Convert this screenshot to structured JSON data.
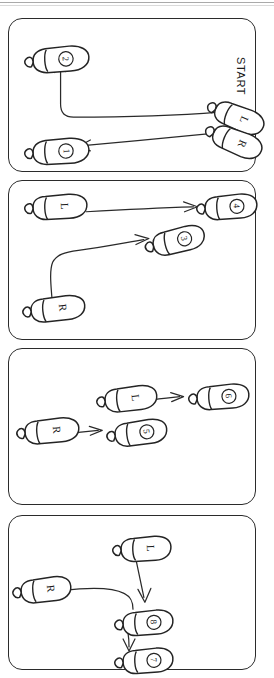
{
  "document": {
    "kind": "hand-drawn footwork / dance step diagram",
    "orientation_note": "sheet scanned sideways; all labels rendered rotated 90 degrees",
    "start_label": "START",
    "foot_side_labels": {
      "left": "L",
      "right": "R"
    }
  },
  "panels": [
    {
      "id": "panel-1",
      "footprints": [
        {
          "name": "footprint-2",
          "label": "2",
          "kind": "numbered"
        },
        {
          "name": "footprint-1",
          "label": "1",
          "kind": "numbered"
        },
        {
          "name": "footprint-start-l",
          "label": "L",
          "kind": "side"
        },
        {
          "name": "footprint-start-r",
          "label": "R",
          "kind": "side"
        }
      ],
      "arrows": [
        {
          "name": "arrow-l-to-2",
          "from": "L",
          "to": "2",
          "path": "bent-left-then-up"
        },
        {
          "name": "arrow-r-to-1",
          "from": "R",
          "to": "1",
          "path": "straight-left"
        }
      ]
    },
    {
      "id": "panel-2",
      "footprints": [
        {
          "name": "footprint-l",
          "label": "L",
          "kind": "side"
        },
        {
          "name": "footprint-4",
          "label": "4",
          "kind": "numbered"
        },
        {
          "name": "footprint-3",
          "label": "3",
          "kind": "numbered"
        },
        {
          "name": "footprint-r",
          "label": "R",
          "kind": "side"
        }
      ],
      "arrows": [
        {
          "name": "arrow-l-to-4",
          "from": "L",
          "to": "4",
          "path": "straight-right"
        },
        {
          "name": "arrow-r-to-3",
          "from": "R",
          "to": "3",
          "path": "up-then-right"
        }
      ]
    },
    {
      "id": "panel-3",
      "footprints": [
        {
          "name": "footprint-l",
          "label": "L",
          "kind": "side"
        },
        {
          "name": "footprint-6",
          "label": "6",
          "kind": "numbered"
        },
        {
          "name": "footprint-r",
          "label": "R",
          "kind": "side"
        },
        {
          "name": "footprint-5",
          "label": "5",
          "kind": "numbered"
        }
      ],
      "arrows": [
        {
          "name": "arrow-l-to-6",
          "from": "L",
          "to": "6",
          "path": "straight-right"
        },
        {
          "name": "arrow-r-to-5",
          "from": "R",
          "to": "5",
          "path": "straight-right"
        }
      ]
    },
    {
      "id": "panel-4",
      "footprints": [
        {
          "name": "footprint-l",
          "label": "L",
          "kind": "side"
        },
        {
          "name": "footprint-r",
          "label": "R",
          "kind": "side"
        },
        {
          "name": "footprint-8",
          "label": "8",
          "kind": "numbered"
        },
        {
          "name": "footprint-7",
          "label": "7",
          "kind": "numbered"
        }
      ],
      "arrows": [
        {
          "name": "arrow-l-to-8",
          "from": "L",
          "to": "8",
          "path": "straight-down"
        },
        {
          "name": "arrow-r-to-8",
          "from": "R",
          "to": "8",
          "path": "curve-right-then-down"
        },
        {
          "name": "arrow-8-to-7",
          "from": "8",
          "to": "7",
          "path": "short-down"
        }
      ]
    }
  ],
  "colors": {
    "ink": "#2a2a2a",
    "paper": "#ffffff",
    "panel_border": "#2b2b2b"
  }
}
